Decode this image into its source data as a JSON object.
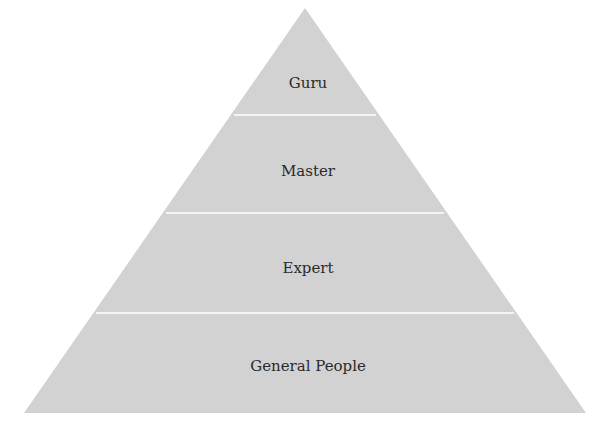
{
  "diagram": {
    "type": "pyramid",
    "fill_color": "#d2d2d2",
    "divider_color": "#f4f4f4",
    "text_color": "#2a2a2a",
    "levels": [
      {
        "label": "Guru"
      },
      {
        "label": "Master"
      },
      {
        "label": "Expert"
      },
      {
        "label": "General People"
      }
    ]
  }
}
